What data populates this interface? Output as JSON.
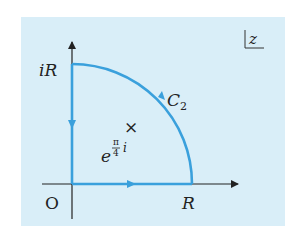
{
  "diagram": {
    "plane_label": "z",
    "labels": {
      "origin": "O",
      "real_endpoint": "R",
      "imag_endpoint": "iR",
      "arc": "C",
      "arc_sub": "2",
      "pole_base": "e",
      "pole_exp_num": "π",
      "pole_exp_den": "4",
      "pole_exp_i": "i"
    },
    "pole_marker": "×",
    "colors": {
      "background": "#d9eef8",
      "contour": "#3aa0dc",
      "axes": "#222222"
    }
  }
}
